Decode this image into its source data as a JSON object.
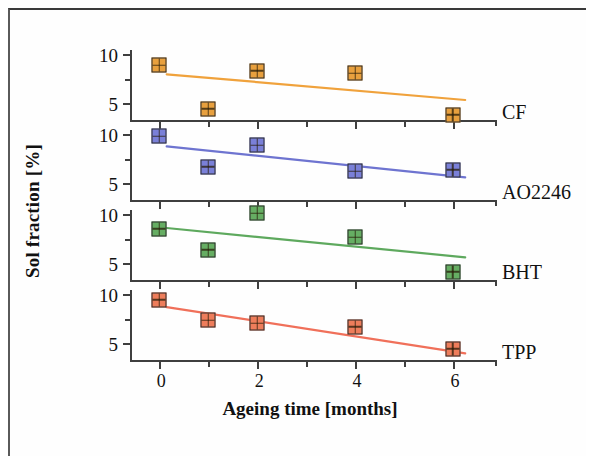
{
  "chart_data": {
    "type": "scatter",
    "title": "",
    "xlabel": "Ageing time [months]",
    "ylabel": "Sol fraction [%]",
    "x": [
      0,
      1,
      2,
      4,
      6
    ],
    "xlim": [
      -0.6,
      6.9
    ],
    "x_major_ticks": [
      0,
      2,
      4,
      6
    ],
    "x_major_tick_labels": [
      "0",
      "2",
      "4",
      "6"
    ],
    "x_minor_ticks": [
      1,
      3,
      5
    ],
    "y_scale": "log",
    "ylim": [
      3.8,
      10.6
    ],
    "y_major_ticks": [
      10,
      5
    ],
    "y_major_tick_labels": [
      "10",
      "5"
    ],
    "y_minor_ticks": [
      7
    ],
    "grid": false,
    "legend": "panel-right-labels",
    "panels": [
      {
        "name": "CF",
        "label": "CF",
        "color": "#F0A23C",
        "marker_fill": "#E8A03E",
        "marker_edge": "#2b2b2b",
        "values": [
          8.5,
          4.6,
          7.9,
          7.6,
          4.2
        ],
        "fit_start_y": 7.5,
        "fit_end_y": 5.2
      },
      {
        "name": "AO2246",
        "label": "AO2246",
        "color": "#6E74D0",
        "marker_fill": "#7A80D8",
        "marker_edge": "#2b2b2b",
        "values": [
          9.7,
          6.3,
          8.5,
          5.9,
          6.0
        ],
        "fit_start_y": 8.4,
        "fit_end_y": 5.4
      },
      {
        "name": "BHT",
        "label": "BHT",
        "color": "#5EA95E",
        "marker_fill": "#66AE63",
        "marker_edge": "#2b2b2b",
        "values": [
          8.1,
          6.0,
          10.1,
          7.2,
          4.4
        ],
        "fit_start_y": 8.2,
        "fit_end_y": 5.4
      },
      {
        "name": "TPP",
        "label": "TPP",
        "color": "#F0705A",
        "marker_fill": "#EE7D5B",
        "marker_edge": "#2b2b2b",
        "values": [
          9.2,
          6.9,
          6.6,
          6.3,
          4.6
        ],
        "fit_start_y": 8.3,
        "fit_end_y": 4.3
      }
    ]
  },
  "axes": {
    "x_title": "Ageing time [months]",
    "y_title": "Sol fraction [%]"
  }
}
